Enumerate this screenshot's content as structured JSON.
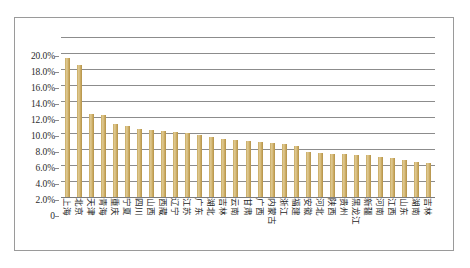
{
  "chart_data": {
    "type": "bar",
    "title": "",
    "xlabel": "",
    "ylabel": "",
    "ylim": [
      0,
      20
    ],
    "grid": true,
    "legend": "none",
    "bar_color": "#c9a95e",
    "ytick_labels": [
      "20.0%",
      "18.0%",
      "16.0%",
      "14.0%",
      "12.0%",
      "10.0%",
      "8.0%",
      "6.0%",
      "4.0%",
      "2.0%",
      "0"
    ],
    "ytick_values": [
      20,
      18,
      16,
      14,
      12,
      10,
      8,
      6,
      4,
      2,
      0
    ],
    "categories": [
      "上海",
      "北京",
      "天津",
      "青海",
      "重庆",
      "宁夏",
      "四川",
      "山西",
      "西藏",
      "辽宁",
      "江苏",
      "广东",
      "湖北",
      "吉林",
      "云南",
      "甘肃",
      "广西",
      "内蒙古",
      "浙江",
      "福建",
      "安徽",
      "河北",
      "陕西",
      "贵州",
      "黑龙江",
      "新疆",
      "河南",
      "江西",
      "山东",
      "湖南",
      "吉林"
    ],
    "values": [
      17.4,
      16.5,
      10.4,
      10.3,
      9.1,
      8.9,
      8.5,
      8.4,
      8.2,
      8.1,
      8.0,
      7.7,
      7.5,
      7.3,
      7.1,
      7.0,
      6.9,
      6.8,
      6.6,
      6.4,
      5.6,
      5.5,
      5.4,
      5.4,
      5.3,
      5.2,
      5.0,
      4.9,
      4.6,
      4.4,
      4.3
    ]
  }
}
